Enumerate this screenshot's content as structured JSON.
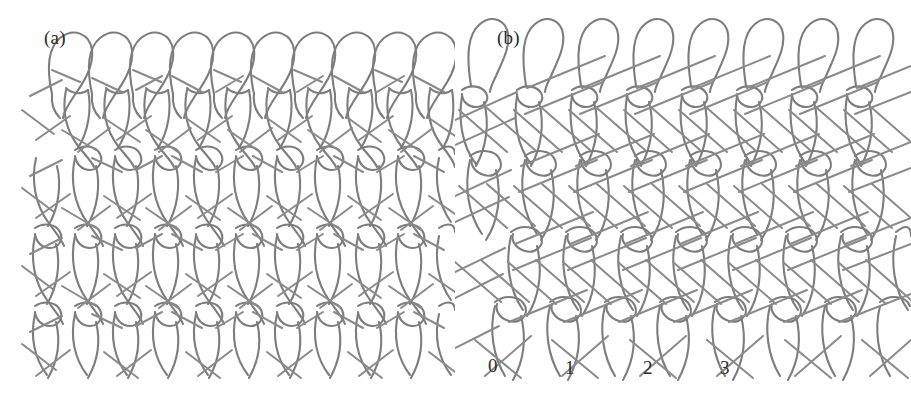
{
  "figure": {
    "background_color": "#ffffff",
    "yarn_color": "#7d7d7d",
    "text_color": "#2b2b2b",
    "panels": [
      {
        "id": "a",
        "label": "(a)",
        "wales": 7,
        "courses": 4,
        "course_labels": []
      },
      {
        "id": "b",
        "label": "(b)",
        "wales": 7,
        "courses": 4,
        "course_labels": [
          "0",
          "1",
          "2",
          "3"
        ]
      }
    ]
  },
  "panel_a": {
    "label": "(a)"
  },
  "panel_b": {
    "label": "(b)",
    "guide_bar_labels": [
      {
        "text": "0",
        "x": 33,
        "y": 355
      },
      {
        "text": "1",
        "x": 110,
        "y": 357
      },
      {
        "text": "2",
        "x": 188,
        "y": 357
      },
      {
        "text": "3",
        "x": 265,
        "y": 357
      }
    ]
  }
}
